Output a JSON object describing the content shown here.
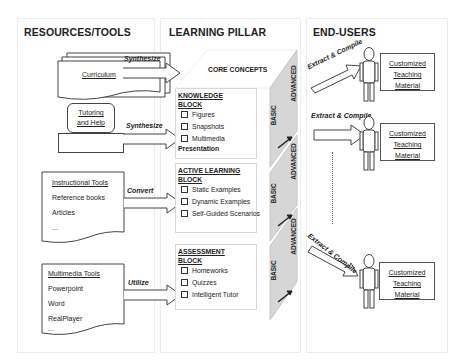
{
  "columns": {
    "resources": {
      "heading": "RESOURCES/TOOLS",
      "items": [
        {
          "label": "Curriculum",
          "arrow": "Synthesize"
        },
        {
          "label_line1": "Tutoring",
          "label_line2": "and Help",
          "arrow": "Synthesize"
        },
        {
          "title": "Instructional Tools",
          "lines": [
            "Reference books",
            "Articles",
            "..."
          ],
          "arrow": "Convert"
        },
        {
          "title": "Multimedia Tools",
          "lines": [
            "Powerpoint",
            "Word",
            "RealPlayer",
            "..."
          ],
          "arrow": "Utilize"
        }
      ]
    },
    "pillar": {
      "heading": "LEARNING PILLAR",
      "core": "CORE CONCEPTS",
      "levels": {
        "basic": "BASIC",
        "advanced": "ADVANCED"
      },
      "blocks": [
        {
          "title_line1": "KNOWLEDGE",
          "title_line2": "BLOCK",
          "items": [
            "Figures",
            "Snapshots",
            "Multimedia"
          ],
          "extra": "Presentation"
        },
        {
          "title_line1": "ACTIVE LEARNING",
          "title_line2": "BLOCK",
          "items": [
            "Static Examples",
            "Dynamic Examples",
            "Self-Guided Scenarios"
          ]
        },
        {
          "title_line1": "ASSESSMENT",
          "title_line2": "BLOCK",
          "items": [
            "Homeworks",
            "Quizzes",
            "Intelligent Tutor"
          ]
        }
      ]
    },
    "users": {
      "heading": "END-USERS",
      "arrow_label": "Extract & Compile",
      "material": {
        "line1": "Customized",
        "line2": "Teaching",
        "line3": "Material"
      }
    }
  },
  "colors": {
    "cube_side": "#d6d6d6",
    "border": "#444444",
    "panel_border": "#ececec"
  }
}
